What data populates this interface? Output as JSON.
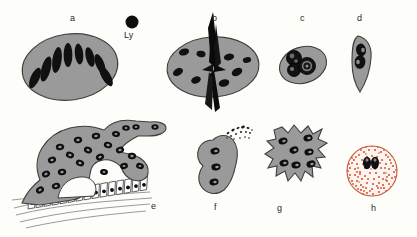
{
  "figure": {
    "background_color": "#fdfdfa",
    "cytoplasm_color": "#9a9a9a",
    "cytoplasm_stroke": "#4a4a4a",
    "nucleus_color": "#111111",
    "granule_color": "#d9532c",
    "epithelium_fill": "#ffffff",
    "panels": [
      {
        "id": "a",
        "label": "a",
        "label_x": 70,
        "label_y": 16,
        "shape": "oval",
        "description": "Langhans-type giant cell, oval body with nuclei arranged in a peripheral horseshoe arc",
        "nuclei_count": 8,
        "nuclei_arrangement": "horseshoe-arc",
        "nucleus_shape": "elongated-oval",
        "has_inclusion": false
      },
      {
        "id": "b",
        "label": "b",
        "label_x": 213,
        "label_y": 16,
        "shape": "oval",
        "description": "Foreign-body giant cell with a large black spindle-shaped crystal inclusion piercing the cell",
        "nuclei_count": 7,
        "nuclei_arrangement": "scattered",
        "nucleus_shape": "oval",
        "has_inclusion": true,
        "inclusion_name": "spindle-crystal"
      },
      {
        "id": "c",
        "label": "c",
        "label_x": 300,
        "label_y": 16,
        "shape": "oval-small",
        "description": "Small giant cell with three overlapping round nuclei bearing nucleoli",
        "nuclei_count": 3,
        "nuclei_arrangement": "clustered-overlapping",
        "nucleus_shape": "round-with-nucleolus",
        "has_inclusion": false
      },
      {
        "id": "d",
        "label": "d",
        "label_x": 357,
        "label_y": 16,
        "shape": "narrow-spindle",
        "description": "Slender elongated cell with a binucleate figure-of-eight nucleus near one pole",
        "nuclei_count": 2,
        "nuclei_arrangement": "fused-pair",
        "nucleus_shape": "figure-eight",
        "has_inclusion": false
      },
      {
        "id": "e",
        "label": "e",
        "label_x": 151,
        "label_y": 204,
        "shape": "amoeboid-branched",
        "description": "Large irregular amoeboid multinucleate cell with finger-like projections resting on a columnar epithelial layer over wavy connective tissue",
        "nuclei_count": 22,
        "nuclei_arrangement": "scattered",
        "nucleus_shape": "ring-oval",
        "has_inclusion": false,
        "substrate": "columnar-epithelium",
        "epithelial_cell_count": 16
      },
      {
        "id": "f",
        "label": "f",
        "label_x": 214,
        "label_y": 205,
        "shape": "bean",
        "description": "Kidney-shaped cell with three stacked nuclei and extruded black debris particles at its upper edge",
        "nuclei_count": 3,
        "nuclei_arrangement": "linear-stack",
        "nucleus_shape": "oval",
        "has_inclusion": false,
        "has_debris": true
      },
      {
        "id": "g",
        "label": "g",
        "label_x": 277,
        "label_y": 206,
        "shape": "stellate-spiky",
        "description": "Star-shaped cell with serrated spiky margins and seven scattered nuclei",
        "nuclei_count": 7,
        "nuclei_arrangement": "scattered",
        "nucleus_shape": "oval",
        "has_inclusion": false
      },
      {
        "id": "h",
        "label": "h",
        "label_x": 371,
        "label_y": 206,
        "shape": "round",
        "description": "Round pale cell densely filled with red-orange cytoplasmic granules and a central pair of dark nuclei",
        "nuclei_count": 2,
        "nuclei_arrangement": "central-pair",
        "nucleus_shape": "round",
        "has_inclusion": false,
        "has_granules": true,
        "granule_count": 210
      }
    ],
    "scale_reference": {
      "id": "Ly",
      "label": "Ly",
      "label_x": 127,
      "label_y": 39,
      "description": "Small solid black circle representing a lymphocyte, shown for size comparison",
      "marker_cx": 132,
      "marker_cy": 22,
      "marker_r": 6.5
    }
  }
}
